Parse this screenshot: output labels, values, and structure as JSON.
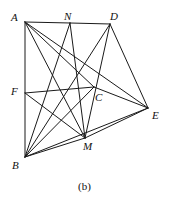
{
  "figure": {
    "caption": "(b)",
    "stroke_color": "#1a1a1a",
    "background_color": "#ffffff",
    "label_color": "#111111",
    "width": 169,
    "height": 202
  },
  "chart_data": {
    "type": "diagram",
    "title": "(b)",
    "subtitle": "",
    "xlabel": "",
    "ylabel": "",
    "grid": false,
    "legend": "none",
    "xlim": [
      0,
      169
    ],
    "ylim": [
      0,
      202
    ],
    "vertices": [
      {
        "id": "A",
        "label": "A",
        "x": 25,
        "y": 22,
        "label_x": 11,
        "label_y": 12
      },
      {
        "id": "N",
        "label": "N",
        "x": 70,
        "y": 23,
        "label_x": 64,
        "label_y": 11
      },
      {
        "id": "D",
        "label": "D",
        "x": 110,
        "y": 24,
        "label_x": 110,
        "label_y": 11
      },
      {
        "id": "F",
        "label": "F",
        "x": 25,
        "y": 93,
        "label_x": 11,
        "label_y": 86
      },
      {
        "id": "C",
        "label": "C",
        "x": 94,
        "y": 87,
        "label_x": 95,
        "label_y": 92
      },
      {
        "id": "E",
        "label": "E",
        "x": 148,
        "y": 108,
        "label_x": 152,
        "label_y": 110
      },
      {
        "id": "M",
        "label": "M",
        "x": 85,
        "y": 138,
        "label_x": 83,
        "label_y": 141
      },
      {
        "id": "B",
        "label": "B",
        "x": 25,
        "y": 157,
        "label_x": 12,
        "label_y": 160
      }
    ],
    "edges": [
      {
        "from": "A",
        "to": "N"
      },
      {
        "from": "N",
        "to": "D"
      },
      {
        "from": "A",
        "to": "B"
      },
      {
        "from": "B",
        "to": "M"
      },
      {
        "from": "M",
        "to": "E"
      },
      {
        "from": "D",
        "to": "E"
      },
      {
        "from": "A",
        "to": "C"
      },
      {
        "from": "A",
        "to": "E"
      },
      {
        "from": "A",
        "to": "M"
      },
      {
        "from": "N",
        "to": "B"
      },
      {
        "from": "N",
        "to": "M"
      },
      {
        "from": "D",
        "to": "B"
      },
      {
        "from": "D",
        "to": "M"
      },
      {
        "from": "F",
        "to": "M"
      },
      {
        "from": "F",
        "to": "C"
      },
      {
        "from": "C",
        "to": "E"
      },
      {
        "from": "B",
        "to": "C"
      },
      {
        "from": "B",
        "to": "E"
      }
    ]
  }
}
